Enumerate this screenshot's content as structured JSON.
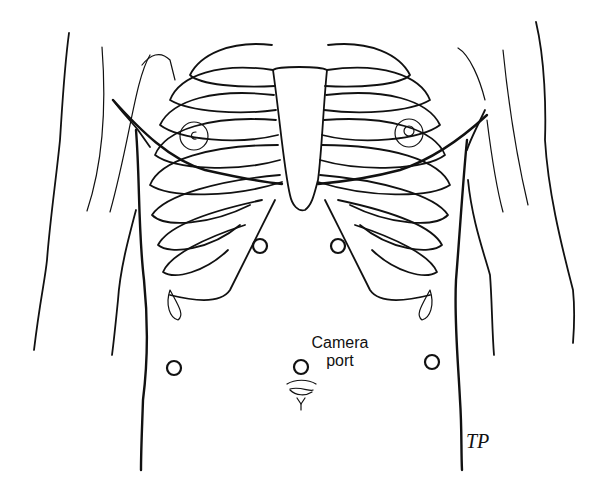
{
  "figure": {
    "type": "anatomical line illustration",
    "labels": {
      "camera_port_line1": "Camera",
      "camera_port_line2": "port"
    },
    "signature": "TP",
    "ports": [
      {
        "id": "upper-left-port",
        "cx": 260,
        "cy": 246,
        "r": 7
      },
      {
        "id": "upper-right-port",
        "cx": 338,
        "cy": 246,
        "r": 7
      },
      {
        "id": "lower-left-port",
        "cx": 174,
        "cy": 368,
        "r": 7
      },
      {
        "id": "camera-port",
        "cx": 301,
        "cy": 367,
        "r": 7
      },
      {
        "id": "lower-right-port",
        "cx": 432,
        "cy": 362,
        "r": 7
      }
    ],
    "colors": {
      "line": "#111111",
      "background": "#ffffff"
    }
  }
}
